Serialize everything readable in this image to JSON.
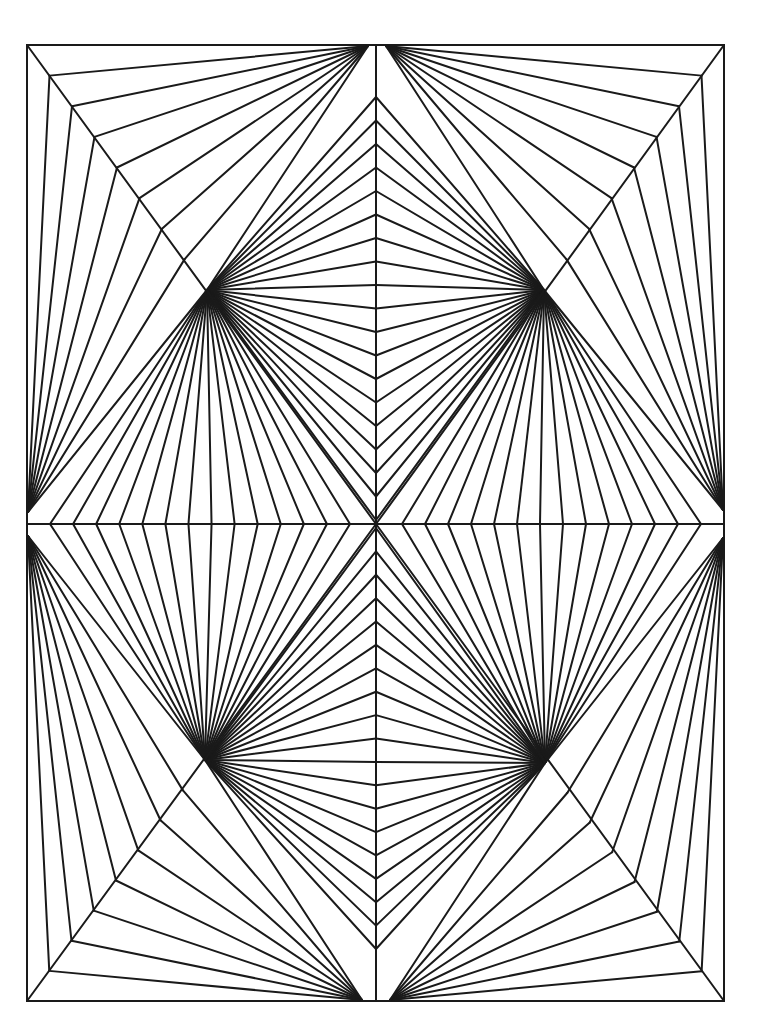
{
  "artwork": {
    "title": "Geometric string-art line drawing",
    "background": "#ffffff",
    "stroke_color": "#1a1a1a",
    "stroke_width": 2,
    "frame": {
      "x1": 27,
      "y1": 45,
      "x2": 724,
      "y2": 1001
    },
    "center": {
      "x": 376,
      "y": 524
    },
    "top_fans": [
      {
        "x": 368,
        "y": 46
      },
      {
        "x": 386,
        "y": 46
      }
    ],
    "bottom_fans": [
      {
        "x": 362,
        "y": 1000
      },
      {
        "x": 390,
        "y": 1000
      }
    ],
    "left_fans": [
      {
        "x": 28,
        "y": 512
      },
      {
        "x": 28,
        "y": 536
      }
    ],
    "right_fans": [
      {
        "x": 723,
        "y": 510
      },
      {
        "x": 723,
        "y": 538
      }
    ],
    "quadrant_fans": {
      "top_left": {
        "x": 207,
        "y": 290
      },
      "top_right": {
        "x": 544,
        "y": 290
      },
      "bottom_left": {
        "x": 205,
        "y": 760
      },
      "bottom_right": {
        "x": 545,
        "y": 763
      }
    },
    "diagonal_steps": 8,
    "vertical_points_per_half": 19,
    "horizontal_points_per_half": 14
  }
}
